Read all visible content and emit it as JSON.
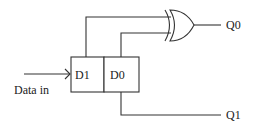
{
  "diagram": {
    "type": "logic-circuit",
    "register": {
      "cells": [
        {
          "label": "D1"
        },
        {
          "label": "D0"
        }
      ]
    },
    "gate": {
      "type": "XOR"
    },
    "input": {
      "label": "Data in"
    },
    "outputs": [
      {
        "label": "Q0"
      },
      {
        "label": "Q1"
      }
    ],
    "colors": {
      "line": "#333333",
      "text": "#222222",
      "background": "#ffffff"
    }
  }
}
